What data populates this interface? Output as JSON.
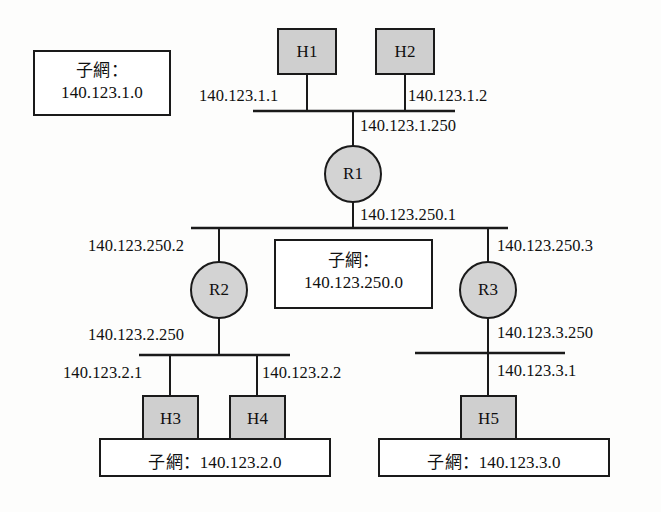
{
  "diagram": {
    "colors": {
      "node_fill": "#cfcfcf",
      "router_fill": "#d3d3d3",
      "line": "#1a1a1a",
      "background": "#fdfdfc",
      "box_fill": "#ffffff"
    },
    "hosts": [
      {
        "id": "h1",
        "label": "H1"
      },
      {
        "id": "h2",
        "label": "H2"
      },
      {
        "id": "h3",
        "label": "H3"
      },
      {
        "id": "h4",
        "label": "H4"
      },
      {
        "id": "h5",
        "label": "H5"
      }
    ],
    "routers": [
      {
        "id": "r1",
        "label": "R1"
      },
      {
        "id": "r2",
        "label": "R2"
      },
      {
        "id": "r3",
        "label": "R3"
      }
    ],
    "addresses": {
      "h1": "140.123.1.1",
      "h2": "140.123.1.2",
      "r1_top": "140.123.1.250",
      "r1_bottom": "140.123.250.1",
      "r2_top": "140.123.250.2",
      "r3_top": "140.123.250.3",
      "r2_bottom": "140.123.2.250",
      "r3_bottom": "140.123.3.250",
      "h3": "140.123.2.1",
      "h4": "140.123.2.2",
      "h5": "140.123.3.1"
    },
    "subnet_boxes": [
      {
        "id": "subnet-1",
        "line1": "子網：",
        "line2": "140.123.1.0",
        "layout": "two-line"
      },
      {
        "id": "subnet-250",
        "line1": "子網：",
        "line2": "140.123.250.0",
        "layout": "two-line"
      },
      {
        "id": "subnet-2",
        "line1": "子網：140.123.2.0",
        "layout": "one-line"
      },
      {
        "id": "subnet-3",
        "line1": "子網：140.123.3.0",
        "layout": "one-line"
      }
    ]
  }
}
